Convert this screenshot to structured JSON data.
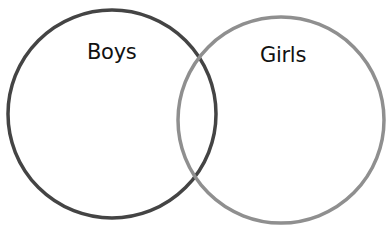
{
  "diagram": {
    "type": "venn",
    "sets": [
      {
        "label": "Boys",
        "stroke_color": "#444444",
        "center": [
          112,
          114
        ],
        "radius": 104
      },
      {
        "label": "Girls",
        "stroke_color": "#8f8f8f",
        "center": [
          281,
          120
        ],
        "radius": 103
      }
    ],
    "background": "#ffffff"
  }
}
